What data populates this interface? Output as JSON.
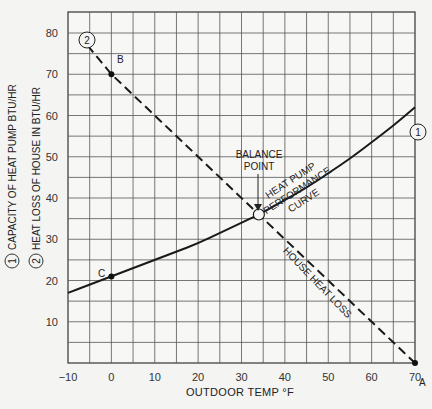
{
  "chart_data": {
    "type": "line",
    "title": "",
    "xlabel": "OUTDOOR TEMP °F",
    "ylabel_lines": [
      {
        "marker": "1",
        "text": "CAPACITY OF HEAT PUMP BTU/HR"
      },
      {
        "marker": "2",
        "text": "HEAT LOSS OF HOUSE IN BTU/HR"
      }
    ],
    "xlim": [
      -10,
      70
    ],
    "ylim": [
      0,
      85
    ],
    "x_ticks": [
      -10,
      0,
      10,
      20,
      30,
      40,
      50,
      60,
      70
    ],
    "x_tick_labels": [
      "−10",
      "0",
      "10",
      "20",
      "30",
      "40",
      "50",
      "60",
      "70"
    ],
    "y_ticks": [
      10,
      20,
      30,
      40,
      50,
      60,
      70,
      80
    ],
    "y_tick_labels": [
      "10",
      "20",
      "30",
      "40",
      "50",
      "60",
      "70",
      "80"
    ],
    "grid": true,
    "grid_step": 5,
    "series": [
      {
        "name": "HEAT PUMP PERFORMANCE CURVE",
        "marker_label": "1",
        "style": "solid",
        "x": [
          -10,
          -5,
          0,
          5,
          10,
          15,
          20,
          25,
          30,
          34,
          40,
          45,
          50,
          55,
          60,
          65,
          70
        ],
        "y": [
          17,
          19,
          21,
          23,
          25,
          27,
          29,
          31.5,
          34,
          36,
          39.5,
          42.5,
          46,
          49.5,
          53.5,
          57.5,
          62
        ]
      },
      {
        "name": "HOUSE HEAT LOSS",
        "marker_label": "2",
        "style": "dashed",
        "x": [
          -5.5,
          0,
          34,
          70
        ],
        "y": [
          77,
          70,
          36,
          0
        ]
      }
    ],
    "points": [
      {
        "label": "A",
        "x": 70,
        "y": 0
      },
      {
        "label": "B",
        "x": 0,
        "y": 70
      },
      {
        "label": "C",
        "x": 0,
        "y": 21
      },
      {
        "label": "BALANCE POINT",
        "x": 34,
        "y": 36
      }
    ],
    "annotations": [
      {
        "text_lines": [
          "BALANCE",
          "POINT"
        ],
        "x": 34,
        "y": 47
      },
      {
        "text_lines": [
          "HEAT PUMP",
          "PERFORMANCE",
          "CURVE"
        ],
        "x": 48,
        "y": 42
      },
      {
        "text": "HOUSE HEAT LOSS",
        "x": 50,
        "y": 20
      }
    ]
  },
  "labels": {
    "x_axis": "OUTDOOR TEMP °F",
    "y_axis_1": "CAPACITY OF HEAT PUMP BTU/HR",
    "y_axis_2": "HEAT LOSS OF HOUSE IN BTU/HR",
    "marker_1": "1",
    "marker_2": "2",
    "point_a": "A",
    "point_b": "B",
    "point_c": "C",
    "balance_1": "BALANCE",
    "balance_2": "POINT",
    "hp_1": "HEAT PUMP",
    "hp_2": "PERFORMANCE",
    "hp_3": "CURVE",
    "house_loss": "HOUSE HEAT LOSS"
  }
}
